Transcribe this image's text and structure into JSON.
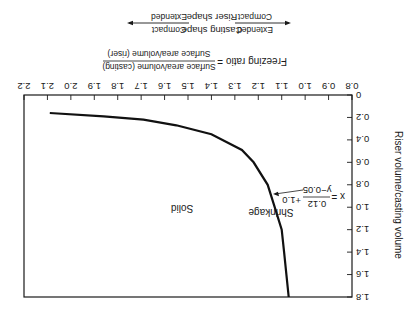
{
  "orientation": "rotated-180",
  "chart_data": {
    "type": "line",
    "title": "",
    "xlabel": "Freezing ratio",
    "ylabel": "Riser volume/casting volume",
    "xlim": [
      0.8,
      2.2
    ],
    "ylim": [
      0,
      1.8
    ],
    "x_ticks": [
      "0.8",
      "0.9",
      "1.0",
      "1.1",
      "1.2",
      "1.3",
      "1.4",
      "1.5",
      "1.6",
      "1.7",
      "1.8",
      "1.9",
      "2.0",
      "2.1",
      "2.2"
    ],
    "y_ticks": [
      "0",
      "0.2",
      "0.4",
      "0.6",
      "0.8",
      "1.0",
      "1.2",
      "1.4",
      "1.6",
      "1.8"
    ],
    "grid": false,
    "series": [
      {
        "name": "x = 0.12/(y-0.05) + 1.0",
        "x": [
          2.09,
          1.86,
          1.69,
          1.55,
          1.4,
          1.27,
          1.22,
          1.16,
          1.13,
          1.1,
          1.09,
          1.08,
          1.07
        ],
        "y": [
          0.16,
          0.19,
          0.22,
          0.27,
          0.35,
          0.49,
          0.6,
          0.8,
          1.0,
          1.2,
          1.4,
          1.6,
          1.8
        ]
      }
    ],
    "annotations": [
      {
        "text": "Solid",
        "x": 1.55,
        "y": 0.55
      },
      {
        "text": "Shrinkage",
        "x": 0.98,
        "y": 0.58
      },
      {
        "text": "x = 0.12/(y−0.05) + 1.0",
        "x": 1.0,
        "y": 1.1,
        "arrow_to": [
          1.12,
          1.05
        ]
      }
    ]
  },
  "labels": {
    "ylabel": "Riser volume/casting volume",
    "freezing_ratio": "Freezing ratio =",
    "fraction_top": "Surface area/volume (casting)",
    "fraction_bottom": "Surface area/volume (riser)",
    "casting_shape": "Casting shape",
    "riser_shape": "Riser shape",
    "left_top": "Extended",
    "left_bottom": "Compact",
    "right_top": "Compact",
    "right_bottom": "Extended",
    "solid": "Solid",
    "shrinkage": "Shrinkage",
    "eq_lhs": "x =",
    "eq_num": "0.12",
    "eq_den": "y−0.05",
    "eq_plus": "+1.0"
  }
}
